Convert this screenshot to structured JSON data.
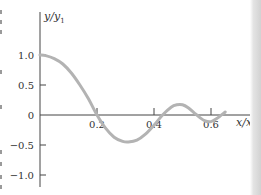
{
  "chart_data": {
    "type": "line",
    "title": "",
    "xlabel": "x/x1",
    "ylabel": "y/y1",
    "xlim": [
      0,
      0.75
    ],
    "ylim": [
      -1.2,
      1.35
    ],
    "grid": false,
    "legend": null,
    "x_ticks": [
      0.2,
      0.4,
      0.6
    ],
    "x_tick_labels": [
      "0.2",
      "0.4",
      "0.6"
    ],
    "y_ticks": [
      1.0,
      0.5,
      0,
      -0.5,
      -1.0
    ],
    "y_tick_labels": [
      "1.0",
      "0.5",
      "0",
      "−0.5",
      "−1.0"
    ],
    "series": [
      {
        "name": "y/y1",
        "color": "#b3b3b3",
        "x": [
          0.0,
          0.02,
          0.05,
          0.08,
          0.11,
          0.14,
          0.17,
          0.2,
          0.23,
          0.26,
          0.29,
          0.31,
          0.34,
          0.37,
          0.4,
          0.43,
          0.46,
          0.48,
          0.5,
          0.52,
          0.54,
          0.56,
          0.58,
          0.6,
          0.62,
          0.65
        ],
        "values": [
          1.0,
          0.99,
          0.94,
          0.85,
          0.7,
          0.5,
          0.27,
          0.0,
          -0.22,
          -0.37,
          -0.44,
          -0.45,
          -0.42,
          -0.32,
          -0.17,
          0.0,
          0.13,
          0.17,
          0.17,
          0.12,
          0.04,
          -0.04,
          -0.1,
          -0.11,
          -0.06,
          0.05
        ]
      }
    ]
  },
  "colors": {
    "axis": "#444444",
    "curve": "#b3b3b3",
    "text": "#333333"
  }
}
